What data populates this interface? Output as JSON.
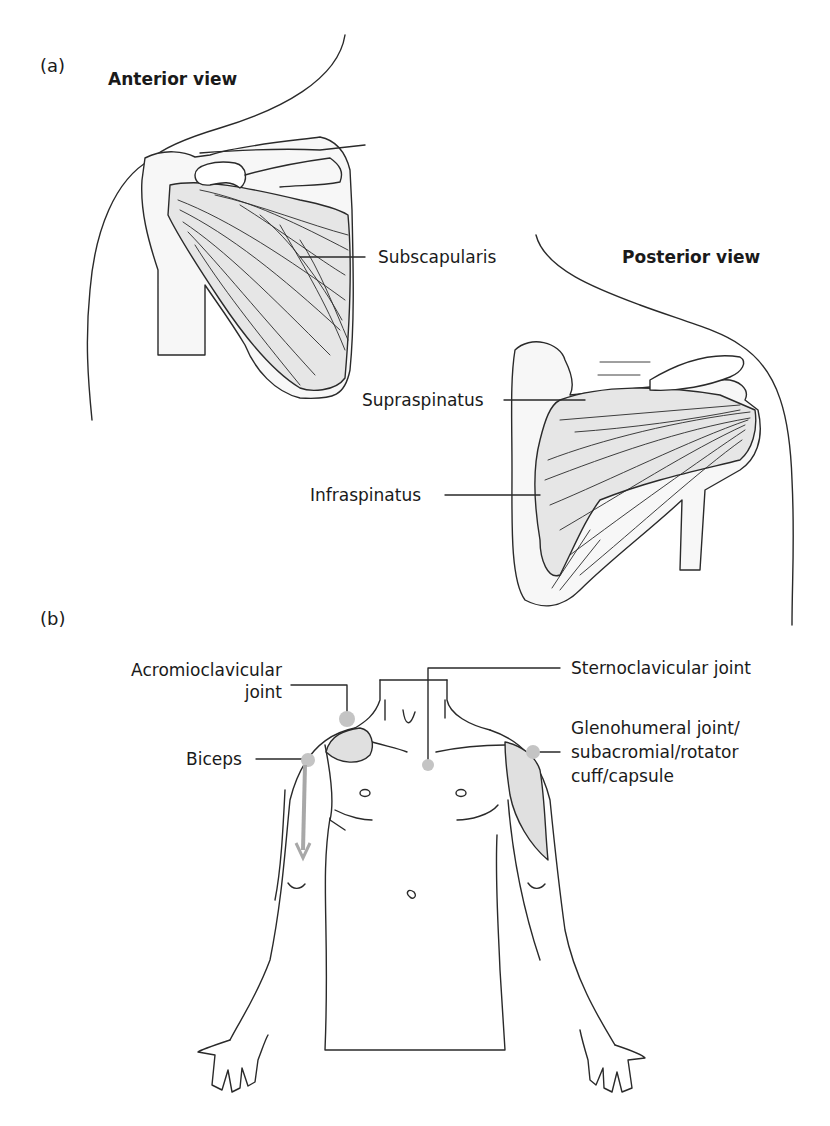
{
  "panel_a": {
    "label": "(a)",
    "anterior": {
      "title": "Anterior view",
      "labels": {
        "subscapularis": "Subscapularis"
      }
    },
    "posterior": {
      "title": "Posterior view",
      "labels": {
        "supraspinatus": "Supraspinatus",
        "infraspinatus": "Infraspinatus"
      }
    }
  },
  "panel_b": {
    "label": "(b)",
    "labels": {
      "acromioclavicular_1": "Acromioclavicular",
      "acromioclavicular_2": "joint",
      "sternoclavicular": "Sternoclavicular joint",
      "biceps": "Biceps",
      "glenohumeral_1": "Glenohumeral joint/",
      "glenohumeral_2": "subacromial/rotator",
      "glenohumeral_3": "cuff/capsule"
    }
  },
  "colors": {
    "line": "#2a2a2a",
    "muscle_fill": "#e6e6e6",
    "marker": "#c4c4c4",
    "arrow": "#a8a8a8",
    "region_fill": "#e0e0e0"
  }
}
